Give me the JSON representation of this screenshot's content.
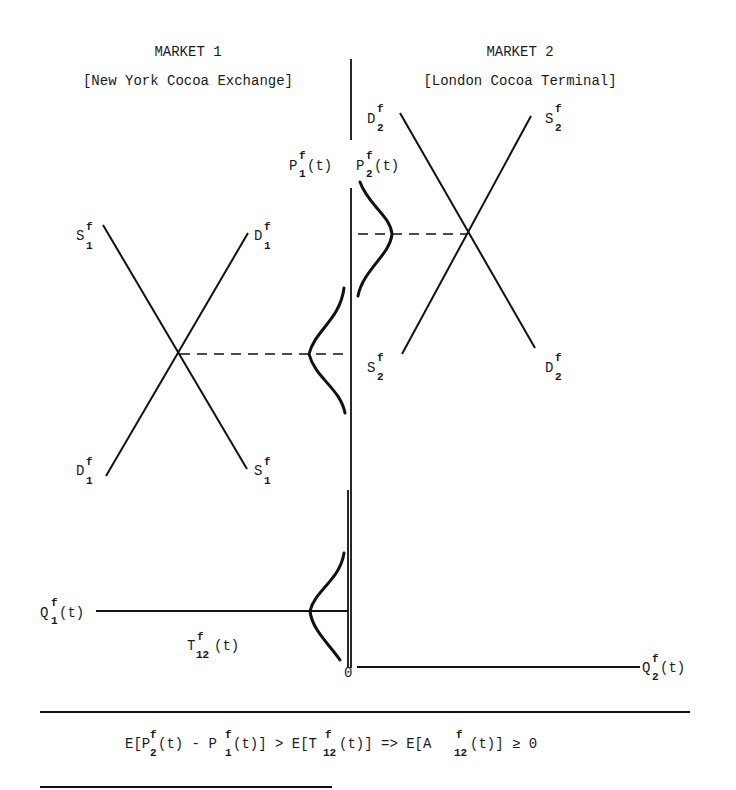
{
  "markets": {
    "left": {
      "title": "MARKET 1",
      "subtitle": "[New York Cocoa Exchange]"
    },
    "right": {
      "title": "MARKET 2",
      "subtitle": "[London Cocoa Terminal]"
    }
  },
  "axes": {
    "price_left": {
      "base": "P",
      "sup": "f",
      "sub": "1",
      "tail": "(t)"
    },
    "price_right": {
      "base": "P",
      "sup": "f",
      "sub": "2",
      "tail": "(t)"
    },
    "quantity_left": {
      "base": "Q",
      "sup": "f",
      "sub": "1",
      "tail": "(t)"
    },
    "quantity_right": {
      "base": "Q",
      "sup": "f",
      "sub": "2",
      "tail": "(t)"
    },
    "origin": "0",
    "transport_cost": {
      "base": "T",
      "sup": "f",
      "sub": "12",
      "tail": "(t)"
    }
  },
  "curves": {
    "market1": {
      "supply_top": {
        "base": "S",
        "sup": "f",
        "sub": "1"
      },
      "demand_top": {
        "base": "D",
        "sup": "f",
        "sub": "1"
      },
      "demand_bottom": {
        "base": "D",
        "sup": "f",
        "sub": "1"
      },
      "supply_bottom": {
        "base": "S",
        "sup": "f",
        "sub": "1"
      }
    },
    "market2": {
      "demand_top": {
        "base": "D",
        "sup": "f",
        "sub": "2"
      },
      "supply_top": {
        "base": "S",
        "sup": "f",
        "sub": "2"
      },
      "supply_bottom": {
        "base": "S",
        "sup": "f",
        "sub": "2"
      },
      "demand_bottom": {
        "base": "D",
        "sup": "f",
        "sub": "2"
      }
    }
  },
  "equation": {
    "part1": "E[P",
    "sup1": "f",
    "sub1": "2",
    "part2": "(t) - P",
    "sup2": "f",
    "sub2": "1",
    "part3": "(t)] > E[T",
    "sup3": "f",
    "sub3": "12",
    "part4": "(t)]  => E[A",
    "sup4": "f",
    "sub4": "12",
    "part5": "(t)] ≥  0"
  }
}
